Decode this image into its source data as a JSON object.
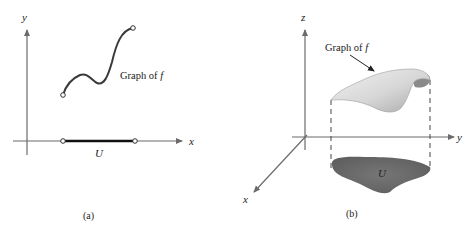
{
  "figure_a": {
    "caption": "(a)",
    "x_axis_label": "x",
    "y_axis_label": "y",
    "curve_label": "Graph of ",
    "curve_label_symbol": "f",
    "domain_label": "U"
  },
  "figure_b": {
    "caption": "(b)",
    "x_axis_label": "x",
    "y_axis_label": "y",
    "z_axis_label": "z",
    "surface_label": "Graph of ",
    "surface_label_symbol": "f",
    "domain_label": "U"
  },
  "colors": {
    "axis": "#6b6b6b",
    "curve": "#3a3a3a",
    "domain_region": "#6e6e6e",
    "surface_light": "#e4e4e4",
    "surface_dark": "#8f8f8f"
  }
}
